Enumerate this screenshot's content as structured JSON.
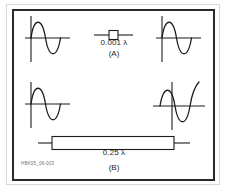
{
  "figure": {
    "id_text": "HBK05_06-003",
    "sections": [
      {
        "key": "A",
        "section_label": "(A)",
        "length_label": "0.001 λ",
        "component": "short-transmission-line-segment",
        "input_waveform": {
          "name": "input-sine-wave",
          "phase_deg": 0,
          "cycles": 1
        },
        "output_waveform": {
          "name": "output-sine-wave",
          "phase_deg": 0,
          "cycles": 1
        },
        "phase_shift_note": "in-phase"
      },
      {
        "key": "B",
        "section_label": "(B)",
        "length_label": "0.25 λ",
        "component": "quarter-wave-transmission-line-segment",
        "input_waveform": {
          "name": "input-sine-wave",
          "phase_deg": 0,
          "cycles": 1
        },
        "output_waveform": {
          "name": "output-sine-wave",
          "phase_deg": 90,
          "cycles": 1
        },
        "phase_shift_note": "delayed-90-degrees"
      }
    ]
  },
  "colors": {
    "ink": "#1d1d1d",
    "frame": "#2b2b2b",
    "outer_rule": "#d8d8d8",
    "background": "#ffffff",
    "id_text": "#6e6e6e"
  }
}
